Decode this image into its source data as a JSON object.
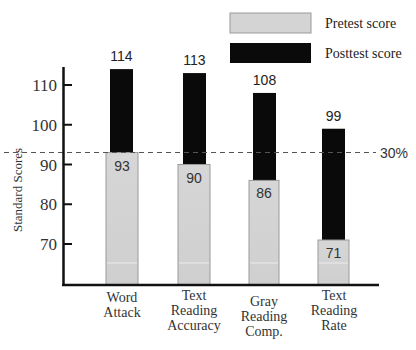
{
  "chart_data": {
    "type": "bar",
    "stacked_overlay": true,
    "title": "",
    "xlabel": "",
    "ylabel": "Standard Scores",
    "ylim": [
      60,
      115
    ],
    "yticks": [
      70,
      80,
      90,
      100,
      110
    ],
    "categories": [
      "Word Attack",
      "Text Reading Accuracy",
      "Gray Reading Comp.",
      "Text Reading Rate"
    ],
    "category_lines": [
      [
        "Word",
        "Attack"
      ],
      [
        "Text",
        "Reading",
        "Accuracy"
      ],
      [
        "Gray",
        "Reading",
        "Comp."
      ],
      [
        "Text",
        "Reading",
        "Rate"
      ]
    ],
    "series": [
      {
        "name": "Pretest score",
        "color": "#d4d4d4",
        "values": [
          93,
          90,
          86,
          71
        ]
      },
      {
        "name": "Posttest score",
        "color": "#0a0a0a",
        "values": [
          114,
          113,
          108,
          99
        ]
      }
    ],
    "reference_line": {
      "value": 93,
      "label": "30%",
      "style": "dashed"
    },
    "legend": {
      "position": "top-right",
      "entries": [
        "Pretest score",
        "Posttest score"
      ]
    },
    "grid": false
  }
}
